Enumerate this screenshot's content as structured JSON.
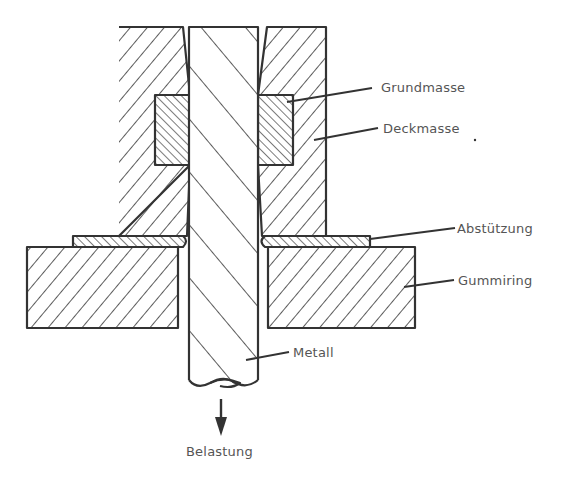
{
  "diagram": {
    "labels": {
      "grundmasse": "Grundmasse",
      "deckmasse": "Deckmasse",
      "abstuetzung": "Abstützung",
      "gummiring": "Gummiring",
      "metall": "Metall",
      "belastung": "Belastung"
    },
    "parts": [
      {
        "id": "metal-rod",
        "label": "Metall",
        "hatch": "backslash-wide"
      },
      {
        "id": "embedding-base",
        "label": "Grundmasse",
        "hatch": "backslash-fine"
      },
      {
        "id": "cover-compound",
        "label": "Deckmasse",
        "hatch": "slash"
      },
      {
        "id": "support-strip",
        "label": "Abstützung",
        "hatch": "backslash-fine"
      },
      {
        "id": "rubber-ring",
        "label": "Gummiring",
        "hatch": "slash"
      }
    ],
    "load_arrow": {
      "direction": "down",
      "label": "Belastung"
    },
    "colors": {
      "line": "#333333",
      "text": "#555555",
      "background": "#ffffff"
    }
  }
}
